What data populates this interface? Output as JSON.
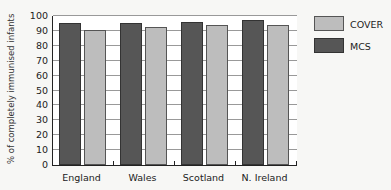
{
  "chart_data": {
    "type": "bar",
    "title": "",
    "xlabel": "",
    "ylabel": "% of completely immunised infants",
    "categories": [
      "England",
      "Wales",
      "Scotland",
      "N. Ireland"
    ],
    "series": [
      {
        "name": "MCS",
        "color": "#565656",
        "values": [
          95,
          95,
          96,
          97
        ]
      },
      {
        "name": "COVER",
        "color": "#bdbdbd",
        "values": [
          90.5,
          92.5,
          94,
          94
        ]
      }
    ],
    "ylim": [
      0,
      100
    ],
    "yticks": [
      0,
      10,
      20,
      30,
      40,
      50,
      60,
      70,
      80,
      90,
      100
    ],
    "grid": true,
    "legend": {
      "position": "right",
      "entries": [
        "COVER",
        "MCS"
      ]
    }
  },
  "legend": {
    "cover_label": "COVER",
    "mcs_label": "MCS"
  }
}
